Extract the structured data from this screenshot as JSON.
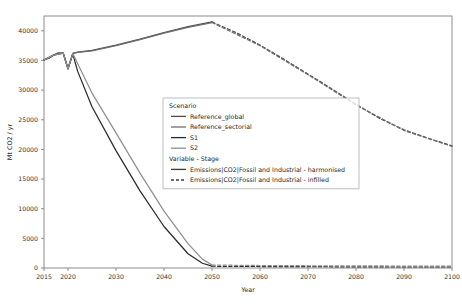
{
  "chart_data": {
    "type": "line",
    "title": "",
    "xlabel": "Year",
    "ylabel": "Mt CO2 / yr",
    "xlim": [
      2015,
      2100
    ],
    "ylim": [
      0,
      42500
    ],
    "grid": false,
    "xticks": [
      2015,
      2020,
      2030,
      2040,
      2050,
      2060,
      2070,
      2080,
      2090,
      2100
    ],
    "xticklabels": [
      "2015",
      "2020",
      "2030",
      "2040",
      "2050",
      "2060",
      "2070",
      "2080",
      "2090",
      "2100"
    ],
    "yticks": [
      0,
      5000,
      10000,
      15000,
      20000,
      25000,
      30000,
      35000,
      40000
    ],
    "yticklabels": [
      "0",
      "5000",
      "10000",
      "15000",
      "20000",
      "25000",
      "30000",
      "35000",
      "40000"
    ],
    "legend_position": "center",
    "legend_groups": [
      {
        "title": "Scenario",
        "entries": [
          {
            "label": "Reference_global",
            "color": "#4d4d4d",
            "dash": "solid"
          },
          {
            "label": "Reference_sectorial",
            "color": "#6e6e6e",
            "dash": "solid"
          },
          {
            "label": "S1",
            "color": "#2b2b2b",
            "dash": "solid"
          },
          {
            "label": "S2",
            "color": "#8f8f8f",
            "dash": "solid"
          }
        ]
      },
      {
        "title": "Variable - Stage",
        "entries": [
          {
            "label": "Emissions|CO2|Fossil and Industrial - harmonised",
            "color": "#3a3a3a",
            "dash": "solid"
          },
          {
            "label": "Emissions|CO2|Fossil and Industrial - infilled",
            "color": "#3a3a3a",
            "dash": "dashed"
          }
        ]
      }
    ],
    "series": [
      {
        "name": "Reference_global - harmonised",
        "scenario": "Reference_global",
        "stage": "harmonised",
        "color": "#4d4d4d",
        "dash": "solid",
        "x": [
          2015,
          2016,
          2017,
          2018,
          2019,
          2020,
          2021,
          2022,
          2025,
          2030,
          2035,
          2040,
          2045,
          2050
        ],
        "y": [
          35100,
          35400,
          35900,
          36300,
          36250,
          33600,
          36200,
          36400,
          36700,
          37600,
          38600,
          39700,
          40700,
          41500
        ]
      },
      {
        "name": "Reference_global - infilled",
        "scenario": "Reference_global",
        "stage": "infilled",
        "color": "#4d4d4d",
        "dash": "dashed",
        "x": [
          2050,
          2055,
          2060,
          2065,
          2070,
          2075,
          2080,
          2085,
          2090,
          2095,
          2100
        ],
        "y": [
          41500,
          39700,
          37600,
          35200,
          32700,
          30200,
          27600,
          25200,
          23300,
          21900,
          20600
        ]
      },
      {
        "name": "Reference_sectorial - harmonised",
        "scenario": "Reference_sectorial",
        "stage": "harmonised",
        "color": "#6e6e6e",
        "dash": "solid",
        "x": [
          2015,
          2016,
          2017,
          2018,
          2019,
          2020,
          2021,
          2022,
          2025,
          2030,
          2035,
          2040,
          2045,
          2050
        ],
        "y": [
          35100,
          35400,
          35900,
          36300,
          36250,
          33600,
          36200,
          36350,
          36600,
          37500,
          38500,
          39600,
          40600,
          41400
        ]
      },
      {
        "name": "Reference_sectorial - infilled",
        "scenario": "Reference_sectorial",
        "stage": "infilled",
        "color": "#6e6e6e",
        "dash": "dashed",
        "x": [
          2050,
          2060,
          2070,
          2080,
          2090,
          2100
        ],
        "y": [
          41400,
          37500,
          32600,
          27500,
          23200,
          20500
        ]
      },
      {
        "name": "S1 - harmonised",
        "scenario": "S1",
        "stage": "harmonised",
        "color": "#2b2b2b",
        "dash": "solid",
        "x": [
          2015,
          2017,
          2019,
          2020,
          2021,
          2022,
          2025,
          2030,
          2035,
          2040,
          2045,
          2048,
          2050
        ],
        "y": [
          35100,
          35900,
          36250,
          33600,
          36100,
          33200,
          27200,
          19800,
          13000,
          7000,
          2400,
          800,
          300
        ]
      },
      {
        "name": "S1 - infilled",
        "scenario": "S1",
        "stage": "infilled",
        "color": "#2b2b2b",
        "dash": "dashed",
        "x": [
          2050,
          2060,
          2070,
          2080,
          2090,
          2100
        ],
        "y": [
          300,
          250,
          220,
          200,
          180,
          170
        ]
      },
      {
        "name": "S2 - harmonised",
        "scenario": "S2",
        "stage": "harmonised",
        "color": "#8f8f8f",
        "dash": "solid",
        "x": [
          2015,
          2017,
          2019,
          2020,
          2021,
          2022,
          2025,
          2030,
          2035,
          2040,
          2045,
          2048,
          2050
        ],
        "y": [
          35100,
          35900,
          36250,
          33600,
          36150,
          34500,
          29500,
          22800,
          16000,
          9600,
          4100,
          1500,
          500
        ]
      },
      {
        "name": "S2 - infilled",
        "scenario": "S2",
        "stage": "infilled",
        "color": "#8f8f8f",
        "dash": "dashed",
        "x": [
          2050,
          2060,
          2070,
          2080,
          2090,
          2100
        ],
        "y": [
          500,
          420,
          380,
          350,
          330,
          320
        ]
      }
    ]
  }
}
